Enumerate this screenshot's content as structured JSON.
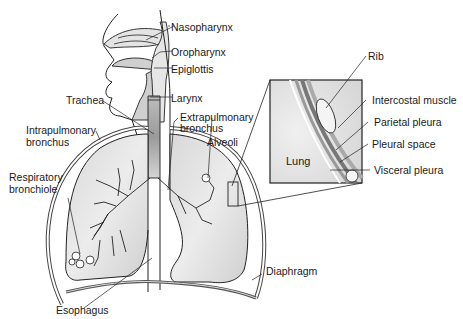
{
  "diagram": {
    "labels": {
      "nasopharynx": "Nasopharynx",
      "oropharynx": "Oropharynx",
      "epiglottis": "Epiglottis",
      "larynx": "Larynx",
      "trachea": "Trachea",
      "extrapulmonary_bronchus_1": "Extrapulmonary",
      "extrapulmonary_bronchus_2": "bronchus",
      "intrapulmonary_bronchus_1": "Intrapulmonary",
      "intrapulmonary_bronchus_2": "bronchus",
      "alveoli": "Alveoli",
      "respiratory_bronchiole_1": "Respiratory",
      "respiratory_bronchiole_2": "bronchiole",
      "esophagus": "Esophagus",
      "diaphragm": "Diaphragm",
      "rib": "Rib",
      "intercostal_muscle": "Intercostal muscle",
      "parietal_pleura": "Parietal pleura",
      "pleural_space": "Pleural space",
      "visceral_pleura": "Visceral pleura",
      "lung": "Lung"
    },
    "colors": {
      "line": "#222222",
      "fill_light": "#e6e6e6",
      "fill_mid": "#cfcfcf",
      "fill_dark": "#a8a8a8",
      "background": "#ffffff"
    }
  }
}
